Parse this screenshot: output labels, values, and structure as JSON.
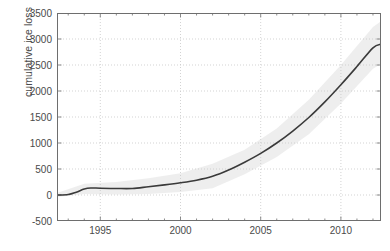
{
  "figure": {
    "background": "#ffffff",
    "axis_color": "#6e6e6e",
    "grid_color": "#c8c8c8",
    "line_color": "#3a3a3a",
    "band_color": "#ebebeb"
  },
  "chart_data": {
    "type": "line",
    "title": "",
    "xlabel": "",
    "ylabel": "cumulative ice loss",
    "xlim": [
      1992.3,
      2012.5
    ],
    "ylim": [
      -500,
      3500
    ],
    "grid": true,
    "legend": null,
    "xticks": [
      1995,
      2000,
      2005,
      2010
    ],
    "xtick_labels": [
      "1995",
      "2000",
      "2005",
      "2010"
    ],
    "yticks": [
      -500,
      0,
      500,
      1000,
      1500,
      2000,
      2500,
      3000,
      3500
    ],
    "ytick_labels": [
      "-500",
      "0",
      "500",
      "1000",
      "1500",
      "2000",
      "2500",
      "3000",
      "3500"
    ],
    "minor_xticks_interval": 1,
    "series": [
      {
        "name": "cumulative ice loss",
        "x": [
          1992.3,
          1993.0,
          1993.5,
          1994.0,
          1994.4,
          1995.0,
          1996.0,
          1997.0,
          1998.0,
          1999.0,
          2000.0,
          2001.0,
          2002.0,
          2003.0,
          2004.0,
          2005.0,
          2006.0,
          2007.0,
          2008.0,
          2009.0,
          2010.0,
          2011.0,
          2012.0,
          2012.5
        ],
        "values": [
          0,
          10,
          55,
          115,
          135,
          130,
          125,
          125,
          160,
          195,
          235,
          285,
          360,
          480,
          630,
          800,
          1000,
          1230,
          1490,
          1790,
          2120,
          2470,
          2830,
          2900
        ]
      }
    ],
    "uncertainty_band": {
      "name": "uncertainty envelope",
      "x": [
        1992.3,
        1994.0,
        1996.0,
        1998.0,
        2000.0,
        2002.0,
        2004.0,
        2006.0,
        2008.0,
        2010.0,
        2012.0,
        2012.5
      ],
      "upper": [
        40,
        215,
        250,
        320,
        420,
        600,
        870,
        1280,
        1830,
        2500,
        3230,
        3340
      ],
      "lower": [
        -40,
        20,
        10,
        20,
        60,
        130,
        400,
        730,
        1170,
        1760,
        2430,
        2520
      ]
    }
  }
}
